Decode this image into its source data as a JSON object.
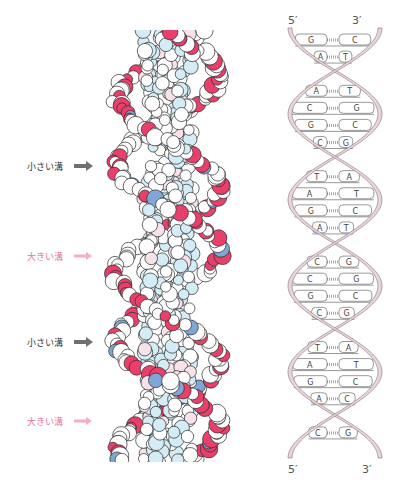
{
  "figure": {
    "left_panel": {
      "type": "space-filling-model",
      "labels": [
        {
          "text": "小さい溝",
          "kind": "minor",
          "y": 166
        },
        {
          "text": "大きい溝",
          "kind": "major",
          "y": 256
        },
        {
          "text": "小さい溝",
          "kind": "minor",
          "y": 342
        },
        {
          "text": "大きい溝",
          "kind": "major",
          "y": 421
        }
      ],
      "colors": {
        "oxygen": "#e8406a",
        "phosphorus": "#7fa6d6",
        "base_light_blue": "#d4ecf5",
        "base_pink": "#f6e2e8",
        "carbon_white": "#ffffff",
        "outline": "#2a2a2a",
        "minor_arrow": "#707070",
        "major_arrow": "#f4aec4"
      }
    },
    "right_panel": {
      "type": "ladder-diagram",
      "top_left_end": "5′",
      "top_right_end": "3′",
      "bottom_left_end": "5′",
      "bottom_right_end": "3′",
      "base_pairs": [
        [
          "G",
          "C"
        ],
        [
          "A",
          "T"
        ],
        [
          "C",
          "G"
        ],
        [
          "A",
          "T"
        ],
        [
          "C",
          "G"
        ],
        [
          "G",
          "C"
        ],
        [
          "C",
          "G"
        ],
        [
          "G",
          "C"
        ],
        [
          "T",
          "A"
        ],
        [
          "A",
          "T"
        ],
        [
          "G",
          "C"
        ],
        [
          "A",
          "T"
        ],
        [
          "T",
          "A"
        ],
        [
          "C",
          "G"
        ],
        [
          "C",
          "G"
        ],
        [
          "G",
          "C"
        ],
        [
          "C",
          "G"
        ],
        [
          "G",
          "C"
        ],
        [
          "T",
          "A"
        ],
        [
          "A",
          "T"
        ],
        [
          "G",
          "C"
        ],
        [
          "A",
          "C"
        ],
        [
          "T",
          "A"
        ],
        [
          "C",
          "G"
        ]
      ],
      "colors": {
        "backbone": "#e9d6dc",
        "backbone_edge": "#8a7078",
        "hbond": "#7fb8df",
        "line": "#555555"
      }
    }
  }
}
